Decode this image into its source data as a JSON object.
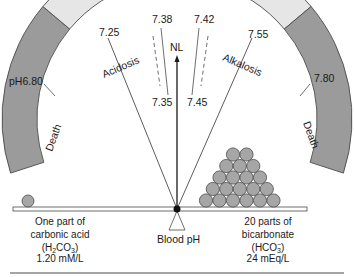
{
  "diagram": {
    "colors": {
      "death": "#9b9b9b",
      "disease": "#e6e6e6",
      "normal": "#ffffff",
      "stroke": "#4a4a4a",
      "sphere": "#a6a6a6",
      "ink": "#1a1a1a"
    },
    "bands": {
      "left_death": "Death",
      "acidosis": "Acidosis",
      "alkalosis": "Alkalosis",
      "right_death": "Death"
    },
    "ticks": {
      "ph_680": "pH6.80",
      "ph_725": "7.25",
      "ph_738": "7.38",
      "ph_735": "7.35",
      "ph_742": "7.42",
      "ph_745": "7.45",
      "ph_755": "7.55",
      "ph_780": "7.80"
    },
    "pointer_label": "NL",
    "fulcrum_label": "Blood pH",
    "left_caption": {
      "line1": "One part of",
      "line2": "carbonic acid",
      "line3_pre": "(H",
      "line3_sub1": "2",
      "line3_mid": "CO",
      "line3_sub2": "3",
      "line3_post": ")",
      "line4": "1.20 mM/L"
    },
    "right_caption": {
      "line1": "20 parts of",
      "line2": "bicarbonate",
      "line3_pre": "(HCO",
      "line3_sub": "3",
      "line3_sup": "−",
      "line3_post": ")",
      "line4": "24 mEq/L"
    },
    "weights": {
      "acid_parts": 1,
      "bicarbonate_parts": 20
    }
  }
}
